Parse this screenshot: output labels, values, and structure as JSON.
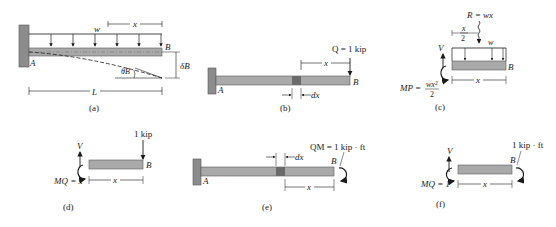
{
  "colors": {
    "beam_fill": "#a9a9a9",
    "beam_stroke": "#5a5a5a",
    "wall_fill": "#8c8c8c",
    "element_fill": "#6a6a6a",
    "line": "#1a1a1a"
  },
  "panels": {
    "a": {
      "caption": "(a)",
      "load_label": "w",
      "x_label": "x",
      "end_label": "B",
      "support_label": "A",
      "deflection_label": "δB",
      "slope_label": "θB",
      "length_label": "L"
    },
    "b": {
      "caption": "(b)",
      "load_label": "Q = 1 kip",
      "x_label": "x",
      "dx_label": "dx",
      "end_label": "B",
      "support_label": "A"
    },
    "c": {
      "caption": "(c)",
      "resultant_label": "R = wx",
      "half_x_num": "x",
      "half_x_den": "2",
      "load_label": "w",
      "shear_label": "V",
      "end_label": "B",
      "moment_label": "MP =",
      "moment_num": "wx²",
      "moment_den": "2",
      "x_label": "x"
    },
    "d": {
      "caption": "(d)",
      "load_label": "1 kip",
      "shear_label": "V",
      "end_label": "B",
      "moment_label": "MQ = x",
      "x_label": "x"
    },
    "e": {
      "caption": "(e)",
      "moment_load_label": "QM = 1 kip · ft",
      "dx_label": "dx",
      "end_label": "B",
      "support_label": "A",
      "x_label": "x"
    },
    "f": {
      "caption": "(f)",
      "moment_load_label": "1 kip · ft",
      "shear_label": "V",
      "end_label": "B",
      "moment_label": "MQ = 1",
      "x_label": "x"
    }
  }
}
